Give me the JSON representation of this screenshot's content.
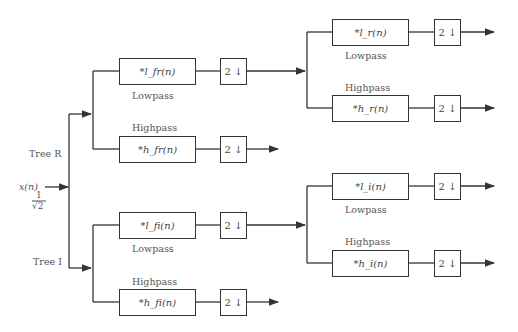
{
  "diagram": {
    "input": {
      "signal": "x(n)",
      "scale_num": "1",
      "scale_den": "√2"
    },
    "trees": [
      {
        "label": "Tree R",
        "stage1": {
          "lowpass": {
            "filter": "*l_fr(n)",
            "label": "Lowpass",
            "downsample": "2 ↓"
          },
          "highpass": {
            "filter": "*h_fr(n)",
            "label": "Highpass",
            "downsample": "2 ↓"
          }
        },
        "stage2": {
          "lowpass": {
            "filter": "*l_r(n)",
            "label": "Lowpass",
            "downsample": "2 ↓"
          },
          "highpass": {
            "filter": "*h_r(n)",
            "label": "Highpass",
            "downsample": "2 ↓"
          }
        }
      },
      {
        "label": "Tree I",
        "stage1": {
          "lowpass": {
            "filter": "*l_fi(n)",
            "label": "Lowpass",
            "downsample": "2 ↓"
          },
          "highpass": {
            "filter": "*h_fi(n)",
            "label": "Highpass",
            "downsample": "2 ↓"
          }
        },
        "stage2": {
          "lowpass": {
            "filter": "*l_i(n)",
            "label": "Lowpass",
            "downsample": "2 ↓"
          },
          "highpass": {
            "filter": "*h_i(n)",
            "label": "Highpass",
            "downsample": "2 ↓"
          }
        }
      }
    ],
    "colors": {
      "line": "#333333",
      "text": "#444444",
      "background": "#ffffff"
    }
  }
}
